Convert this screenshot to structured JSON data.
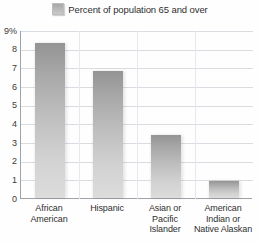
{
  "legend": {
    "swatch_name": "legend-color-swatch",
    "label": "Percent of population 65 and over",
    "color": "#b4b4b4",
    "position": "top-center"
  },
  "chart_data": {
    "type": "bar",
    "title": "",
    "subtitle": "",
    "xlabel": "",
    "ylabel": "",
    "categories": [
      "African American",
      "Hispanic",
      "Asian or Pacific Islander",
      "American Indian or Native Alaskan"
    ],
    "series": [
      {
        "name": "Percent of population 65 and over",
        "values": [
          8.3,
          6.8,
          3.4,
          0.9
        ],
        "color": "#b4b4b4"
      }
    ],
    "values": [
      8.3,
      6.8,
      3.4,
      0.9
    ],
    "ylim": [
      0,
      9
    ],
    "ytick_values": [
      9,
      8,
      7,
      6,
      5,
      4,
      3,
      2,
      1,
      0
    ],
    "ytick_labels": [
      "9%",
      "8",
      "7",
      "6",
      "5",
      "4",
      "3",
      "2",
      "1",
      "0"
    ],
    "grid": true,
    "grid_color": "#d9dde1",
    "legend_position": "top-center",
    "bar_gradient_top": "#949494",
    "bar_gradient_bottom": "#dcdcdc",
    "axis_color": "#9fa3a8",
    "background": "#fefefe"
  },
  "category_label_lines": [
    [
      "African",
      "American"
    ],
    [
      "Hispanic"
    ],
    [
      "Asian or",
      "Pacific",
      "Islander"
    ],
    [
      "American",
      "Indian or",
      "Native Alaskan"
    ]
  ]
}
